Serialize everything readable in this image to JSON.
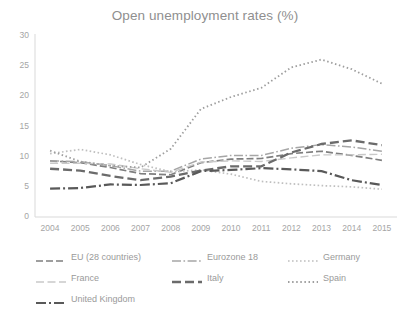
{
  "chart_data": {
    "type": "line",
    "title": "Open unemployment rates (%)",
    "xlabel": "",
    "ylabel": "",
    "x": [
      2004,
      2005,
      2006,
      2007,
      2008,
      2009,
      2010,
      2011,
      2012,
      2013,
      2014,
      2015
    ],
    "categories": [
      "2004",
      "2005",
      "2006",
      "2007",
      "2008",
      "2009",
      "2010",
      "2011",
      "2012",
      "2013",
      "2014",
      "2015"
    ],
    "ylim": [
      0,
      30
    ],
    "yticks": [
      0,
      5,
      10,
      15,
      20,
      25,
      30
    ],
    "ytick_labels": [
      "0",
      "5",
      "10",
      "15",
      "20",
      "25",
      "30"
    ],
    "grid": false,
    "legend_position": "bottom",
    "series": [
      {
        "name": "EU (28 countries)",
        "color": "#7f7f7f",
        "style": "dashed",
        "values": [
          9.3,
          9.0,
          8.2,
          7.2,
          7.0,
          9.0,
          9.6,
          9.7,
          10.5,
          10.9,
          10.2,
          9.4
        ]
      },
      {
        "name": "Eurozone 18",
        "color": "#a6a6a6",
        "style": "dash-dot",
        "values": [
          9.3,
          9.2,
          8.5,
          7.6,
          7.6,
          9.6,
          10.2,
          10.2,
          11.4,
          12.0,
          11.6,
          10.9
        ]
      },
      {
        "name": "Germany",
        "color": "#bfbfbf",
        "style": "dotted",
        "values": [
          10.5,
          11.2,
          10.3,
          8.7,
          7.5,
          7.8,
          7.1,
          5.9,
          5.5,
          5.2,
          5.0,
          4.6
        ]
      },
      {
        "name": "France",
        "color": "#c9c9c9",
        "style": "long-dash",
        "values": [
          8.9,
          8.9,
          8.8,
          8.0,
          7.4,
          9.1,
          9.3,
          9.2,
          9.8,
          10.3,
          10.3,
          10.4
        ]
      },
      {
        "name": "Italy",
        "color": "#6b6b6b",
        "style": "thick-dash",
        "values": [
          8.0,
          7.7,
          6.8,
          6.1,
          6.7,
          7.7,
          8.4,
          8.4,
          10.7,
          12.1,
          12.7,
          11.9
        ]
      },
      {
        "name": "Spain",
        "color": "#9e9e9e",
        "style": "fine-dotted",
        "values": [
          11.0,
          9.2,
          8.5,
          8.2,
          11.3,
          17.9,
          19.9,
          21.4,
          24.8,
          26.1,
          24.5,
          22.1
        ]
      },
      {
        "name": "United Kingdom",
        "color": "#595959",
        "style": "dash-dot-thick",
        "values": [
          4.7,
          4.8,
          5.4,
          5.3,
          5.6,
          7.6,
          7.8,
          8.1,
          7.9,
          7.6,
          6.1,
          5.3
        ]
      }
    ]
  },
  "legend": {
    "rows": [
      [
        {
          "label": "EU (28 countries)",
          "series": 0
        },
        {
          "label": "Eurozone 18",
          "series": 1
        },
        {
          "label": "Germany",
          "series": 2
        }
      ],
      [
        {
          "label": "France",
          "series": 3
        },
        {
          "label": "Italy",
          "series": 4
        },
        {
          "label": "Spain",
          "series": 5
        }
      ],
      [
        {
          "label": "United Kingdom",
          "series": 6
        }
      ]
    ]
  },
  "caption": ""
}
